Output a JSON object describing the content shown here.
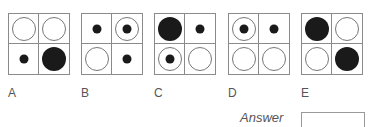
{
  "options": [
    {
      "label": "A",
      "cells": [
        "big-open",
        "big-open",
        "dot",
        "big-filled"
      ]
    },
    {
      "label": "B",
      "cells": [
        "dot",
        "ring-dot",
        "big-open",
        "dot"
      ]
    },
    {
      "label": "C",
      "cells": [
        "big-filled",
        "dot",
        "ring-dot",
        "big-open"
      ]
    },
    {
      "label": "D",
      "cells": [
        "ring-dot",
        "dot",
        "big-open",
        "big-open"
      ]
    },
    {
      "label": "E",
      "cells": [
        "big-filled",
        "big-open",
        "big-open",
        "big-filled"
      ]
    }
  ],
  "answer": {
    "label": "Answer",
    "value": ""
  }
}
